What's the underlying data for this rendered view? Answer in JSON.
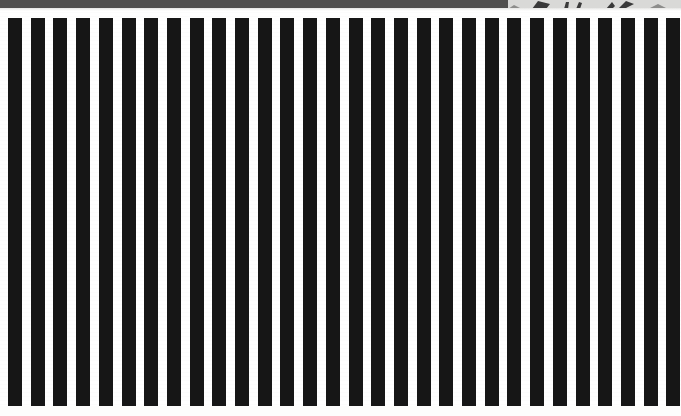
{
  "view": {
    "name": "zoomed-document-view",
    "width": 681,
    "height": 416,
    "background_color": "#ffffff",
    "description": "Extreme close-up crop of a printed page showing a repeating vertical black-and-white stripe (barcode-like) band"
  },
  "top_band": {
    "name": "page-edge-band",
    "color": "#51504f",
    "height": 8,
    "right_light_start": 508,
    "right_light_color": "#d9d9d7"
  },
  "partial_artwork": {
    "name": "clipped-illustration-fragment",
    "left": 508,
    "width": 173,
    "height": 9,
    "color": "#3a3a3a",
    "note": "Only the bottom sliver of an illustration is visible at the top-right edge"
  },
  "stripes": {
    "name": "vertical-stripe-pattern",
    "bar_color": "#161616",
    "gap_color": "#ffffff",
    "top": 18,
    "bottom": 406,
    "height": 388,
    "period": 22.7,
    "bar_width": 14,
    "gap_width": 8.7,
    "count": 30,
    "first_bar_left": 8,
    "positions": [
      8,
      30.7,
      53.4,
      76.1,
      98.8,
      121.5,
      144.2,
      166.9,
      189.6,
      212.3,
      235.0,
      257.7,
      280.4,
      303.1,
      325.8,
      348.5,
      371.2,
      393.9,
      416.6,
      439.3,
      462.0,
      484.7,
      507.4,
      530.1,
      552.8,
      575.5,
      598.2,
      620.9,
      643.6,
      666.3
    ]
  },
  "margins": {
    "name": "page-margins",
    "bottom_height": 10,
    "bottom_color": "#fdfdfc"
  }
}
